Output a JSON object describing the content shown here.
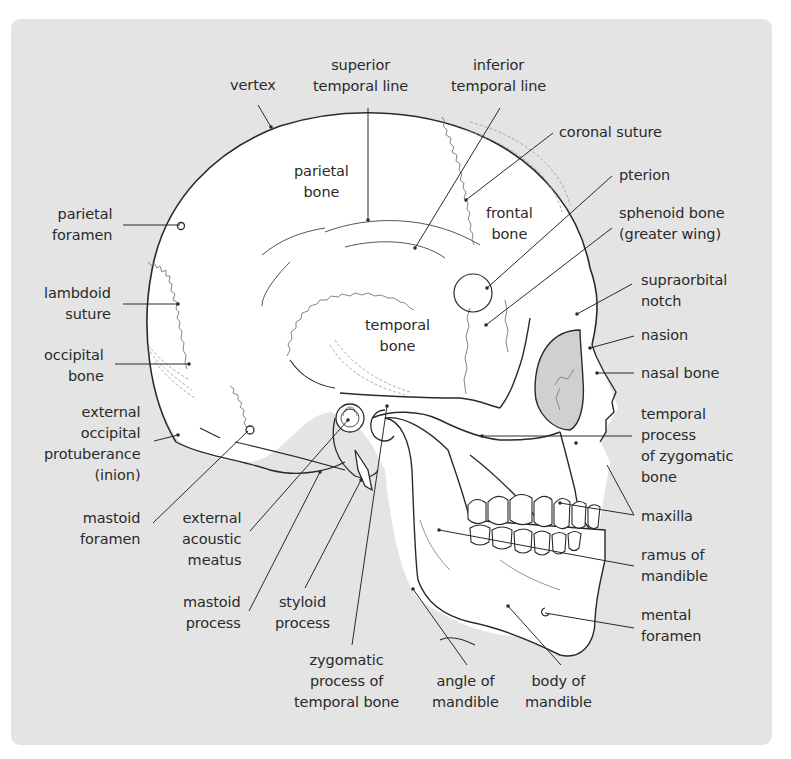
{
  "figure": {
    "colors": {
      "panel_background": "#e4e4e4",
      "bone_fill": "#ffffff",
      "outline": "#2a2a2a",
      "orbit_shade": "#d0d0d0",
      "suture": "#777777"
    }
  },
  "labels": {
    "vertex": "vertex",
    "superior_temporal_line": "superior\ntemporal line",
    "inferior_temporal_line": "inferior\ntemporal line",
    "coronal_suture": "coronal suture",
    "pterion": "pterion",
    "sphenoid_bone": "sphenoid bone\n(greater wing)",
    "parietal_bone": "parietal\nbone",
    "frontal_bone": "frontal\nbone",
    "temporal_bone": "temporal\nbone",
    "parietal_foramen": "parietal\nforamen",
    "lambdoid_suture": "lambdoid\nsuture",
    "occipital_bone": "occipital\nbone",
    "external_occipital_protuberance": "external\noccipital\nprotuberance\n(inion)",
    "mastoid_foramen": "mastoid\nforamen",
    "external_acoustic_meatus": "external\nacoustic\nmeatus",
    "mastoid_process": "mastoid\nprocess",
    "styloid_process": "styloid\nprocess",
    "zygomatic_process": "zygomatic\nprocess of\ntemporal bone",
    "angle_of_mandible": "angle of\nmandible",
    "body_of_mandible": "body of\nmandible",
    "supraorbital_notch": "supraorbital\nnotch",
    "nasion": "nasion",
    "nasal_bone": "nasal bone",
    "temporal_process_zygomatic": "temporal\nprocess\nof zygomatic\nbone",
    "maxilla": "maxilla",
    "ramus_of_mandible": "ramus of\nmandible",
    "mental_foramen": "mental\nforamen"
  }
}
